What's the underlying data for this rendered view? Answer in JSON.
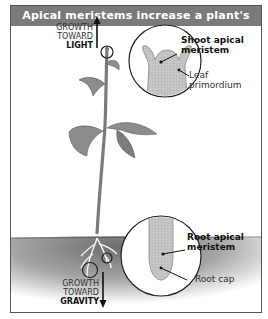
{
  "title": "Apical meristems increase a plant's height",
  "labels": {
    "growth_light": {
      "line1": "GROWTH",
      "line2": "TOWARD",
      "line3": "LIGHT"
    },
    "growth_gravity": {
      "line1": "GROWTH",
      "line2": "TOWARD",
      "line3": "GRAVITY"
    },
    "shoot_apical": {
      "line1": "Shoot apical",
      "line2": "meristem"
    },
    "leaf_primordium": {
      "line1": "Leaf",
      "line2": "primordium"
    },
    "root_apical": {
      "line1": "Root apical",
      "line2": "meristem"
    },
    "root_cap": "Root cap"
  },
  "colors": {
    "title_bg": "#7a7a7a",
    "title_text": "#ffffff",
    "plant": "#8a8a8a",
    "soil": "#9a9a9a"
  }
}
